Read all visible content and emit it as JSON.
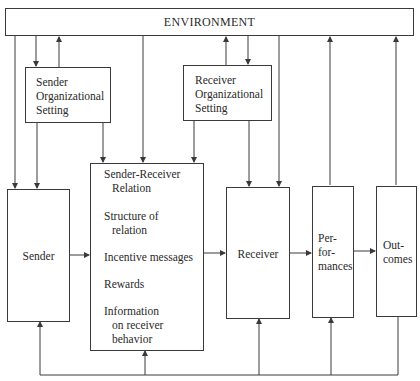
{
  "diagram": {
    "environment": {
      "label": "ENVIRONMENT"
    },
    "sender_org": {
      "lines": [
        "Sender",
        "Organizational",
        "Setting"
      ]
    },
    "receiver_org": {
      "lines": [
        "Receiver",
        "Organizational",
        "Setting"
      ]
    },
    "relation": {
      "title_lines": [
        "Sender-Receiver",
        "Relation"
      ],
      "items": [
        {
          "lines": [
            "Structure of",
            "relation"
          ]
        },
        {
          "lines": [
            "Incentive messages"
          ]
        },
        {
          "lines": [
            "Rewards"
          ]
        },
        {
          "lines": [
            "Information",
            "on receiver",
            "behavior"
          ]
        }
      ]
    },
    "sender": {
      "label": "Sender"
    },
    "receiver": {
      "label": "Receiver"
    },
    "performances": {
      "lines": [
        "Per-",
        "for-",
        "mances"
      ]
    },
    "outcomes": {
      "lines": [
        "Out-",
        "comes"
      ]
    },
    "colors": {
      "line": "#3a3a3a",
      "text": "#2a2a2a",
      "background": "#ffffff"
    }
  }
}
